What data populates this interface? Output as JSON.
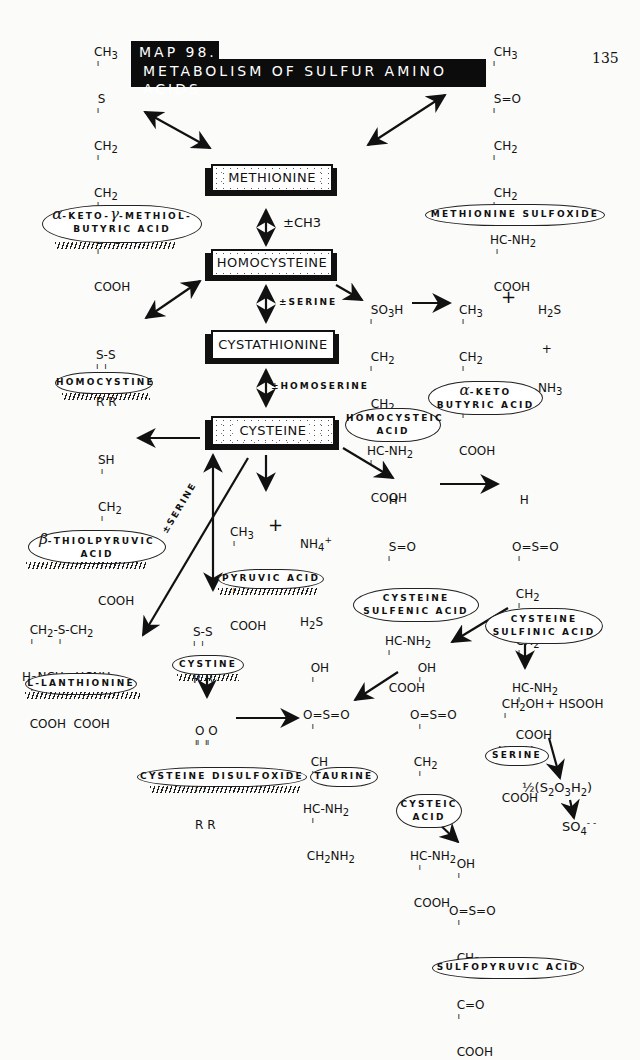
{
  "page": {
    "number": "135",
    "title_line1": "MAP 98.",
    "title_line2": "METABOLISM OF SULFUR AMINO ACIDS"
  },
  "main_compounds": {
    "methionine": "METHIONINE",
    "homocysteine": "HOMOCYSTEINE",
    "cystathionine": "CYSTATHIONINE",
    "cysteine": "CYSTEINE"
  },
  "reaction_labels": {
    "methyl": "±CH3",
    "serine": "±SERINE",
    "homoserine": "±HOMOSERINE",
    "serine_diag": "±SERINE"
  },
  "clouds": {
    "keto_methiol_line1": "-KETO-",
    "keto_methiol_alpha": "α",
    "keto_methiol_gamma": "γ",
    "keto_methiol_line1b": "-METHIOL-",
    "keto_methiol_line2": "BUTYRIC ACID",
    "methionine_sulfoxide": "METHIONINE SULFOXIDE",
    "homocystine": "HOMOCYSTINE",
    "homocysteic_line1": "HOMOCYSTEIC",
    "homocysteic_line2": "ACID",
    "keto_butyric_alpha": "α",
    "keto_butyric_line1": "-KETO",
    "keto_butyric_line2": "BUTYRIC ACID",
    "thiolpyruvic_beta": "β",
    "thiolpyruvic_line1": "-THIOLPYRUVIC",
    "thiolpyruvic_line2": "ACID",
    "pyruvic": "PYRUVIC ACID",
    "sulfenic_line1": "CYSTEINE",
    "sulfenic_line2": "SULFENIC ACID",
    "sulfinic_line1": "CYSTEINE",
    "sulfinic_line2": "SULFINIC ACID",
    "lanthionine": "L-LANTHIONINE",
    "cystine": "CYSTINE",
    "disulfoxide": "CYSTEINE DISULFOXIDE",
    "taurine": "TAURINE",
    "cysteic_line1": "CYSTEIC",
    "cysteic_line2": "ACID",
    "serine": "SERINE",
    "sulfopyruvic": "SULFOPYRUVIC ACID"
  },
  "formulas": {
    "keto_methiol": [
      "CH3",
      "S",
      "CH2",
      "CH2",
      "C=O",
      "COOH"
    ],
    "methionine_sulfoxide": [
      "CH3",
      "S=O",
      "CH2",
      "CH2",
      "HC-NH2",
      "COOH"
    ],
    "homocystine": [
      "S-S",
      "R R"
    ],
    "homocysteic_acid": [
      "SO3H",
      "CH2",
      "CH2",
      "HC-NH2",
      "COOH"
    ],
    "keto_butyric": [
      "CH3",
      "CH2",
      "C=O",
      "COOH"
    ],
    "keto_butyric_byproducts": [
      "H2S",
      "+",
      "NH3"
    ],
    "thiolpyruvic": [
      "SH",
      "CH2",
      "C=O",
      "COOH"
    ],
    "pyruvic": [
      "CH3",
      "C=O",
      "COOH"
    ],
    "pyruvic_byproducts": [
      "NH4+",
      "+",
      "H2S"
    ],
    "sulfenic": [
      "H",
      "S=O",
      "CH2",
      "HC-NH2",
      "COOH"
    ],
    "sulfinic": [
      "H",
      "O=S=O",
      "CH2",
      "CH2",
      "HC-NH2",
      "COOH"
    ],
    "lanthionine": [
      "CH2-S-CH2",
      "H2NCH  HCNH2",
      "COOH  COOH"
    ],
    "cystine": [
      "S-S",
      "R R"
    ],
    "disulfoxide": [
      "O O",
      "S-S",
      "R R"
    ],
    "taurine": [
      "OH",
      "O=S=O",
      "CH",
      "HC-NH2",
      "CH2NH2"
    ],
    "cysteic": [
      "OH",
      "O=S=O",
      "CH2",
      "CH2",
      "HC-NH2",
      "COOH"
    ],
    "serine": [
      "CH2OH",
      "HCNH2",
      "COOH"
    ],
    "serine_byproduct": "+ HSOOH",
    "thiosulfate": "½(S2O3H2)",
    "sulfate": "SO4--",
    "sulfopyruvic": [
      "OH",
      "O=S=O",
      "CH2",
      "C=O",
      "COOH"
    ]
  },
  "plus_sign": "+"
}
